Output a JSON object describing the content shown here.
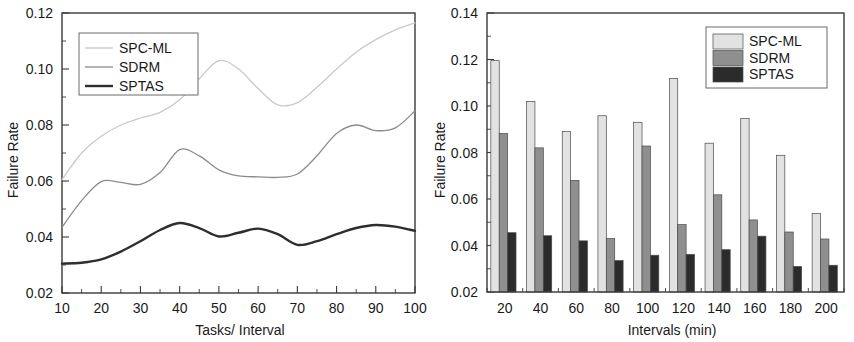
{
  "figure": {
    "panels": [
      "line-chart",
      "bar-chart"
    ]
  },
  "chart_data": [
    {
      "type": "line",
      "title": "",
      "xlabel": "Tasks/ Interval",
      "ylabel": "Failure Rate",
      "xlim": [
        10,
        100
      ],
      "ylim": [
        0.02,
        0.12
      ],
      "xticks": [
        10,
        20,
        30,
        40,
        50,
        60,
        70,
        80,
        90,
        100
      ],
      "xticklabels": [
        "10",
        "20",
        "30",
        "40",
        "50",
        "60",
        "70",
        "80",
        "90",
        "100"
      ],
      "yticks": [
        0.02,
        0.04,
        0.06,
        0.08,
        0.1,
        0.12
      ],
      "yticklabels": [
        "0.02",
        "0.04",
        "0.06",
        "0.08",
        "0.10",
        "0.12"
      ],
      "grid": false,
      "legend_position": "upper-left",
      "x": [
        10,
        15,
        20,
        25,
        30,
        35,
        40,
        45,
        50,
        55,
        60,
        65,
        70,
        75,
        80,
        85,
        90,
        95,
        100
      ],
      "series": [
        {
          "name": "SPC-ML",
          "color": "#c9c9c9",
          "width": 1.3,
          "values": [
            0.0605,
            0.07,
            0.076,
            0.08,
            0.0825,
            0.0845,
            0.089,
            0.0965,
            0.103,
            0.1,
            0.093,
            0.0872,
            0.088,
            0.0935,
            0.1,
            0.106,
            0.1105,
            0.114,
            0.1165
          ]
        },
        {
          "name": "SDRM",
          "color": "#8c8c8c",
          "width": 1.3,
          "values": [
            0.0435,
            0.053,
            0.0598,
            0.0595,
            0.0588,
            0.063,
            0.0712,
            0.069,
            0.064,
            0.0618,
            0.0615,
            0.0613,
            0.0625,
            0.069,
            0.077,
            0.08,
            0.078,
            0.079,
            0.085
          ]
        },
        {
          "name": "SPTAS",
          "color": "#2e2e2e",
          "width": 2.4,
          "values": [
            0.0305,
            0.0308,
            0.032,
            0.0348,
            0.0385,
            0.0425,
            0.045,
            0.0432,
            0.0402,
            0.0415,
            0.043,
            0.041,
            0.0372,
            0.0385,
            0.041,
            0.0432,
            0.0443,
            0.0437,
            0.0422
          ]
        }
      ],
      "legend": [
        {
          "label": "SPC-ML",
          "color": "#c9c9c9"
        },
        {
          "label": "SDRM",
          "color": "#8c8c8c"
        },
        {
          "label": "SPTAS",
          "color": "#2e2e2e"
        }
      ]
    },
    {
      "type": "bar",
      "title": "",
      "xlabel": "Intervals (min)",
      "ylabel": "Failure Rate",
      "ylim": [
        0.02,
        0.14
      ],
      "yticks": [
        0.02,
        0.04,
        0.06,
        0.08,
        0.1,
        0.12,
        0.14
      ],
      "yticklabels": [
        "0.02",
        "0.04",
        "0.06",
        "0.08",
        "0.10",
        "0.12",
        "0.14"
      ],
      "grid": false,
      "legend_position": "upper-right",
      "categories": [
        "20",
        "40",
        "60",
        "80",
        "100",
        "120",
        "140",
        "160",
        "180",
        "200"
      ],
      "series": [
        {
          "name": "SPC-ML",
          "color": "#e2e2e2",
          "values": [
            0.1195,
            0.102,
            0.089,
            0.0958,
            0.093,
            0.1118,
            0.084,
            0.0947,
            0.0788,
            0.0538
          ]
        },
        {
          "name": "SDRM",
          "color": "#8f8f8f",
          "values": [
            0.0882,
            0.082,
            0.068,
            0.043,
            0.0828,
            0.049,
            0.0618,
            0.051,
            0.0458,
            0.0428
          ]
        },
        {
          "name": "SPTAS",
          "color": "#2b2b2b",
          "values": [
            0.0455,
            0.0442,
            0.042,
            0.0335,
            0.0358,
            0.0362,
            0.0382,
            0.044,
            0.031,
            0.0315
          ]
        }
      ],
      "legend": [
        {
          "label": "SPC-ML",
          "color": "#e2e2e2"
        },
        {
          "label": "SDRM",
          "color": "#8f8f8f"
        },
        {
          "label": "SPTAS",
          "color": "#2b2b2b"
        }
      ]
    }
  ]
}
